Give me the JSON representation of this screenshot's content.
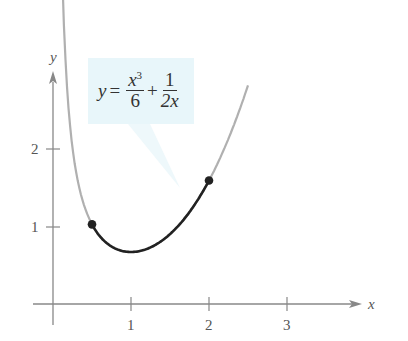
{
  "chart_data": {
    "type": "line",
    "title": "",
    "xlabel": "x",
    "ylabel": "y",
    "xlim": [
      -0.3,
      4.0
    ],
    "ylim": [
      -0.2,
      3.0
    ],
    "x_ticks": [
      "1",
      "2",
      "3"
    ],
    "y_ticks": [
      "1",
      "2"
    ],
    "grid": false,
    "annotation": {
      "text": "y = x^3/6 + 1/(2x)"
    },
    "series": [
      {
        "name": "y = x^3/6 + 1/(2x) (full curve, light gray)",
        "domain": [
          0.12,
          2.5
        ],
        "x": [
          0.15,
          0.25,
          0.5,
          0.75,
          1.0,
          1.25,
          1.5,
          1.75,
          2.0,
          2.25,
          2.5
        ],
        "values": [
          3.334,
          2.003,
          1.021,
          0.737,
          0.667,
          0.726,
          0.896,
          1.179,
          1.583,
          2.121,
          2.804
        ]
      },
      {
        "name": "arc on [1/2, 2] (dark)",
        "domain": [
          0.5,
          2.0
        ],
        "x": [
          0.5,
          0.75,
          1.0,
          1.25,
          1.5,
          1.75,
          2.0
        ],
        "values": [
          1.021,
          0.737,
          0.667,
          0.726,
          0.896,
          1.179,
          1.583
        ]
      }
    ],
    "points": [
      {
        "x": 0.5,
        "y": 1.021
      },
      {
        "x": 2.0,
        "y": 1.583
      }
    ]
  },
  "labels": {
    "x_axis": "x",
    "y_axis": "y",
    "x_tick_1": "1",
    "x_tick_2": "2",
    "x_tick_3": "3",
    "y_tick_1": "1",
    "y_tick_2": "2"
  },
  "equation": {
    "lhs": "y",
    "eq": "=",
    "num1": "x",
    "exp1": "3",
    "den1": "6",
    "plus": "+",
    "num2": "1",
    "den2": "2x"
  },
  "colors": {
    "axis": "#888888",
    "curve_light": "#b0b0b0",
    "curve_dark": "#222222",
    "callout_bg": "#e8f6fa"
  }
}
